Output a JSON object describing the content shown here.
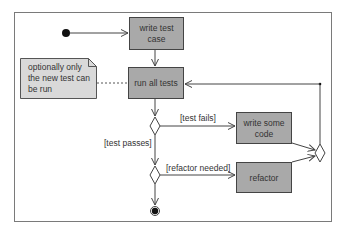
{
  "diagram": {
    "type": "UML activity diagram",
    "colors": {
      "activity_fill": "#a9a9a9",
      "note_fill": "#d9d9d9",
      "stroke": "#444444",
      "frame": "#7a7a7a",
      "background": "#ffffff"
    },
    "activities": {
      "write_test_case": [
        "write test",
        "case"
      ],
      "run_all_tests": "run all tests",
      "write_some_code": [
        "write some",
        "code"
      ],
      "refactor": "refactor"
    },
    "note": [
      "optionally only",
      "the new test can",
      "be run"
    ],
    "guards": {
      "test_fails": "[test fails]",
      "test_passes": "[test passes]",
      "refactor_needed": "[refactor needed]"
    }
  }
}
